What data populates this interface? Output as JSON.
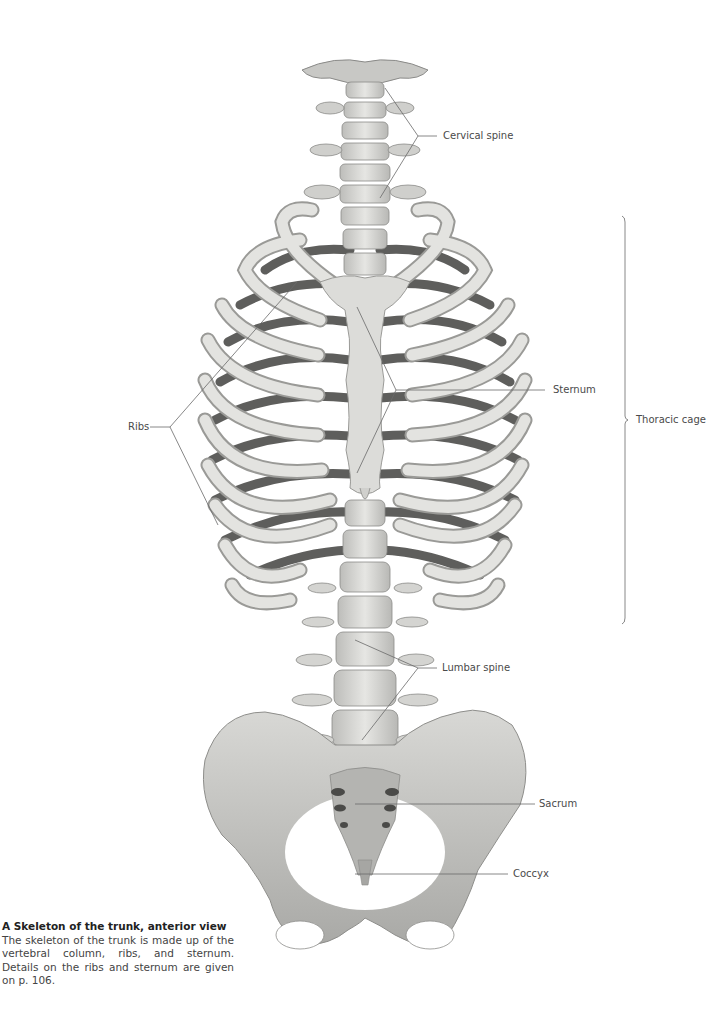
{
  "figure": {
    "type": "anatomical-illustration",
    "subject": "Skeleton of the trunk, anterior view",
    "colors": {
      "background": "#ffffff",
      "bone_light": "#e4e4e1",
      "bone_mid": "#c9c9c6",
      "bone_dark": "#8a8a88",
      "posterior_rib": "#5e5e5c",
      "leader_line": "#6a6a6a",
      "label_text": "#4a4a4a"
    }
  },
  "labels": {
    "cervical_spine": "Cervical spine",
    "thoracic_cage": "Thoracic cage",
    "sternum": "Sternum",
    "ribs": "Ribs",
    "lumbar_spine": "Lumbar spine",
    "sacrum": "Sacrum",
    "coccyx": "Coccyx"
  },
  "caption": {
    "title": "A  Skeleton of the trunk, anterior view",
    "body": "The skeleton of the trunk is made up of the vertebral column, ribs, and sternum. Details on the ribs and sternum are given on p. 106."
  }
}
